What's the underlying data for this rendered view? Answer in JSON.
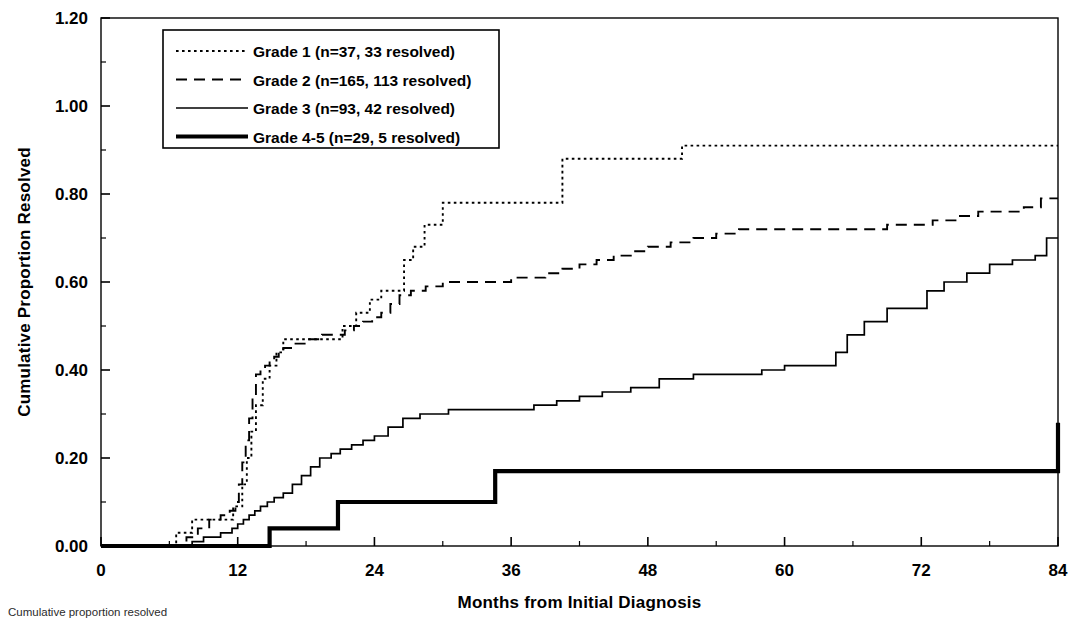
{
  "figure": {
    "title": "",
    "caption": "Cumulative proportion resolved",
    "background_color": "#ffffff",
    "line_color": "#000000"
  },
  "axes": {
    "x": {
      "label": "Months from Initial Diagnosis",
      "ticks": [
        "0",
        "12",
        "24",
        "36",
        "48",
        "60",
        "72",
        "84"
      ],
      "tick_values": [
        0,
        12,
        24,
        36,
        48,
        60,
        72,
        84
      ],
      "minor_tick_step": 6,
      "range": [
        0,
        84
      ]
    },
    "y": {
      "label": "Cumulative Proportion Resolved",
      "ticks": [
        "0.00",
        "0.20",
        "0.40",
        "0.60",
        "0.80",
        "1.00",
        "1.20"
      ],
      "tick_values": [
        0.0,
        0.2,
        0.4,
        0.6,
        0.8,
        1.0,
        1.2
      ],
      "minor_tick_step": 0.1,
      "range": [
        0,
        1.2
      ]
    }
  },
  "legend": {
    "position": "top-left",
    "items": [
      {
        "label": "Grade 1 (n=37, 33 resolved)",
        "style": "dotted",
        "width": 1.8,
        "key": "grade1"
      },
      {
        "label": "Grade 2 (n=165, 113 resolved)",
        "style": "dashed",
        "width": 1.8,
        "key": "grade2"
      },
      {
        "label": "Grade 3 (n=93, 42 resolved)",
        "style": "solid",
        "width": 1.6,
        "key": "grade3"
      },
      {
        "label": "Grade 4-5 (n=29, 5 resolved)",
        "style": "solid-thick",
        "width": 4.0,
        "key": "grade45"
      }
    ]
  },
  "chart_data": {
    "type": "line",
    "subtype": "step-kaplan-meier-cumulative-incidence",
    "title": "",
    "xlabel": "Months from Initial Diagnosis",
    "ylabel": "Cumulative Proportion Resolved",
    "xlim": [
      0,
      84
    ],
    "ylim": [
      0,
      1.2
    ],
    "grid": false,
    "legend_position": "top-left",
    "series": [
      {
        "name": "Grade 1 (n=37, 33 resolved)",
        "style": "dotted",
        "n": 37,
        "resolved": 33,
        "x": [
          0,
          6.0,
          6.6,
          8.0,
          9.0,
          11.0,
          11.6,
          12.0,
          12.4,
          12.8,
          13.2,
          13.6,
          14.2,
          14.8,
          15.4,
          16.0,
          17.0,
          20.0,
          21.2,
          22.4,
          23.6,
          24.6,
          25.6,
          26.6,
          27.4,
          28.4,
          30.0,
          33.0,
          34.5,
          39.5,
          40.5,
          51.0,
          84
        ],
        "y": [
          0.0,
          0.0,
          0.03,
          0.06,
          0.06,
          0.06,
          0.09,
          0.09,
          0.14,
          0.2,
          0.26,
          0.32,
          0.38,
          0.41,
          0.44,
          0.47,
          0.47,
          0.47,
          0.5,
          0.53,
          0.56,
          0.58,
          0.58,
          0.65,
          0.68,
          0.73,
          0.78,
          0.78,
          0.78,
          0.78,
          0.88,
          0.91,
          0.91
        ]
      },
      {
        "name": "Grade 2 (n=165, 113 resolved)",
        "style": "dashed",
        "n": 165,
        "resolved": 113,
        "x": [
          0,
          6.5,
          7.5,
          8.5,
          9.5,
          10.5,
          11.3,
          11.8,
          12.1,
          12.4,
          12.7,
          13.0,
          13.3,
          13.6,
          14.0,
          14.4,
          14.8,
          15.2,
          15.6,
          16.0,
          16.4,
          16.8,
          17.4,
          18.0,
          18.6,
          19.4,
          20.4,
          21.4,
          22.2,
          23.0,
          23.8,
          24.6,
          25.4,
          26.2,
          27.2,
          28.5,
          30.0,
          31.5,
          33.0,
          34.5,
          36.0,
          37.5,
          39.0,
          40.5,
          42.0,
          43.5,
          45.0,
          46.5,
          48.0,
          50.0,
          52.0,
          54.0,
          56.0,
          58.0,
          60.0,
          66.0,
          69.0,
          71.0,
          73.0,
          75.0,
          77.0,
          79.0,
          81.0,
          82.5,
          84
        ],
        "y": [
          0.0,
          0.0,
          0.02,
          0.04,
          0.06,
          0.07,
          0.08,
          0.1,
          0.14,
          0.19,
          0.24,
          0.29,
          0.34,
          0.39,
          0.4,
          0.41,
          0.42,
          0.43,
          0.44,
          0.45,
          0.45,
          0.46,
          0.46,
          0.47,
          0.47,
          0.48,
          0.48,
          0.49,
          0.5,
          0.51,
          0.52,
          0.53,
          0.55,
          0.57,
          0.58,
          0.59,
          0.6,
          0.6,
          0.6,
          0.6,
          0.61,
          0.61,
          0.62,
          0.63,
          0.64,
          0.65,
          0.66,
          0.67,
          0.68,
          0.69,
          0.7,
          0.71,
          0.72,
          0.72,
          0.72,
          0.72,
          0.73,
          0.73,
          0.74,
          0.75,
          0.76,
          0.76,
          0.77,
          0.79,
          0.79
        ]
      },
      {
        "name": "Grade 3 (n=93, 42 resolved)",
        "style": "solid",
        "n": 93,
        "resolved": 42,
        "x": [
          0,
          7.0,
          8.0,
          9.0,
          10.5,
          11.5,
          12.0,
          12.5,
          13.0,
          13.5,
          14.0,
          14.6,
          15.2,
          16.0,
          16.8,
          17.6,
          18.4,
          19.2,
          20.2,
          21.0,
          22.0,
          23.0,
          24.0,
          25.2,
          26.5,
          28.0,
          30.5,
          33.0,
          35.5,
          38.0,
          40.0,
          42.0,
          44.0,
          46.5,
          49.0,
          52.0,
          55.0,
          58.0,
          60.0,
          62.5,
          64.5,
          65.5,
          67.0,
          69.0,
          70.5,
          72.5,
          74.0,
          76.0,
          78.0,
          80.0,
          82.0,
          83.0,
          84
        ],
        "y": [
          0.0,
          0.0,
          0.01,
          0.02,
          0.03,
          0.04,
          0.05,
          0.06,
          0.07,
          0.08,
          0.09,
          0.1,
          0.11,
          0.12,
          0.14,
          0.16,
          0.18,
          0.2,
          0.21,
          0.22,
          0.23,
          0.24,
          0.25,
          0.27,
          0.29,
          0.3,
          0.31,
          0.31,
          0.31,
          0.32,
          0.33,
          0.34,
          0.35,
          0.36,
          0.38,
          0.39,
          0.39,
          0.4,
          0.41,
          0.41,
          0.44,
          0.48,
          0.51,
          0.54,
          0.54,
          0.58,
          0.6,
          0.62,
          0.64,
          0.65,
          0.66,
          0.7,
          0.7
        ]
      },
      {
        "name": "Grade 4-5 (n=29, 5 resolved)",
        "style": "solid-thick",
        "n": 29,
        "resolved": 5,
        "x": [
          0,
          12.0,
          14.8,
          20.8,
          34.6,
          84
        ],
        "y": [
          0.0,
          0.0,
          0.04,
          0.1,
          0.17,
          0.28
        ]
      }
    ],
    "step_events": {
      "grade45_jumps": [
        {
          "month": 12.0,
          "to": 0.04
        },
        {
          "month": 14.8,
          "to": 0.1
        },
        {
          "month": 20.8,
          "to": 0.17
        },
        {
          "month": 34.6,
          "to": 0.28
        }
      ]
    },
    "final_values": {
      "grade1": 0.91,
      "grade2": 0.79,
      "grade3": 0.7,
      "grade45": 0.28
    }
  }
}
